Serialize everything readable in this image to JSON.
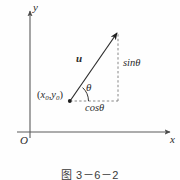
{
  "figure": {
    "caption": "图 3－6－2",
    "axes": {
      "x_label": "x",
      "y_label": "y",
      "origin_label": "O"
    },
    "annotations": {
      "vector_label": "u",
      "angle_label": "θ",
      "vertical_component_label": "sinθ",
      "horizontal_component_label": "cosθ",
      "point_label_open": "(",
      "point_label_x": "x",
      "point_label_x_sub": "0",
      "point_label_comma": ",",
      "point_label_y": "y",
      "point_label_y_sub": "0",
      "point_label_close": ")"
    },
    "colors": {
      "ink": "#2b2b2b",
      "axis": "#5a5a5a",
      "dashed": "#7a7a7a",
      "background": "#fefefe"
    }
  }
}
